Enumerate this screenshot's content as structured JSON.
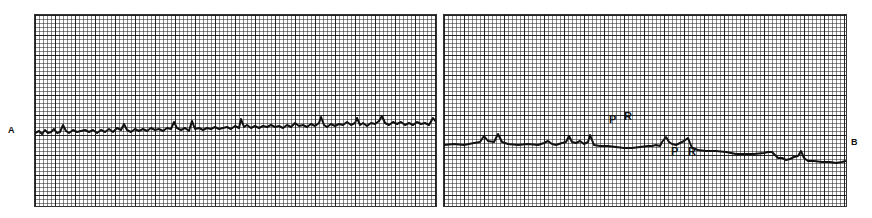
{
  "figure": {
    "panels": [
      {
        "id": "A",
        "label": "A",
        "description": "ECG strip with low-amplitude irregular baseline fibrillatory activity"
      },
      {
        "id": "B",
        "label": "B",
        "description": "ECG strip with gradually descending baseline showing P and R waves",
        "annotations": [
          "P",
          "R",
          "P",
          "R"
        ]
      }
    ],
    "colors": {
      "grid": "#333333",
      "trace": "#111111",
      "background": "#ffffff"
    }
  }
}
